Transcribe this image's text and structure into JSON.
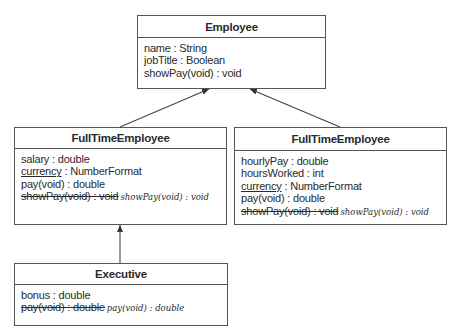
{
  "classes": {
    "employee": {
      "name": "Employee",
      "attributes": [
        "name : String",
        "jobTitle : Boolean",
        "showPay(void) : void"
      ]
    },
    "fulltime": {
      "name": "FullTimeEmployee",
      "row1": "salary : double",
      "row2_static": "currency",
      "row2_rest": " : NumberFormat",
      "row3": "pay(void) : double",
      "row4_struck": "showPay(void) : void",
      "row4_handwritten": "showPay(void) : void"
    },
    "parttime": {
      "name": "FullTimeEmployee",
      "row1": "hourlyPay : double",
      "row2": "hoursWorked : int",
      "row3_static": "currency",
      "row3_rest": " : NumberFormat",
      "row4": "pay(void) : double",
      "row5_struck": "showPay(void) : void",
      "row5_handwritten": "showPay(void) : void"
    },
    "executive": {
      "name": "Executive",
      "row1": "bonus : double",
      "row2_struck": "pay(void) : double",
      "row2_handwritten": "pay(void) : double"
    }
  },
  "relations": [
    {
      "from": "FullTimeEmployee (left)",
      "to": "Employee",
      "type": "generalization"
    },
    {
      "from": "FullTimeEmployee (right)",
      "to": "Employee",
      "type": "generalization"
    },
    {
      "from": "Executive",
      "to": "FullTimeEmployee (left)",
      "type": "generalization"
    }
  ]
}
